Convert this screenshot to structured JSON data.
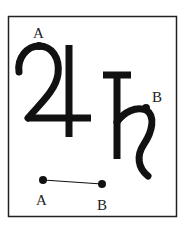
{
  "diagram": {
    "symbols": [
      {
        "name": "jupiter",
        "glyph": "♃",
        "point_label": "A"
      },
      {
        "name": "saturn",
        "glyph": "♄",
        "point_label": "B"
      }
    ],
    "segment": {
      "start_label": "A",
      "end_label": "B"
    },
    "labels": {
      "jupiter_point": "A",
      "saturn_point": "B",
      "segment_start": "A",
      "segment_end": "B"
    },
    "colors": {
      "ink": "#111111",
      "frame": "#222222",
      "background": "#ffffff"
    }
  }
}
